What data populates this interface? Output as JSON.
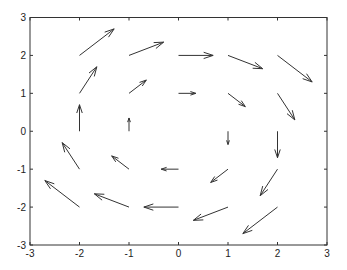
{
  "chart_data": {
    "type": "quiver",
    "title": "",
    "xlabel": "",
    "ylabel": "",
    "xlim": [
      -3,
      3
    ],
    "ylim": [
      -3,
      3
    ],
    "grid": false,
    "legend": null,
    "x_ticks": [
      -3,
      -2,
      -1,
      0,
      1,
      2,
      3
    ],
    "y_ticks": [
      -3,
      -2,
      -1,
      0,
      1,
      2,
      3
    ],
    "x_tick_labels": [
      "-3",
      "-2",
      "-1",
      "0",
      "1",
      "2",
      "3"
    ],
    "y_tick_labels": [
      "-3",
      "-2",
      "-1",
      "0",
      "1",
      "2",
      "3"
    ],
    "field_description": "rotational field u = 0.35*y, v = -0.35*x (clockwise)",
    "vectors": [
      {
        "x": -2,
        "y": -2,
        "u": -0.7,
        "v": 0.7
      },
      {
        "x": -2,
        "y": -1,
        "u": -0.35,
        "v": 0.7
      },
      {
        "x": -2,
        "y": 0,
        "u": 0,
        "v": 0.7
      },
      {
        "x": -2,
        "y": 1,
        "u": 0.35,
        "v": 0.7
      },
      {
        "x": -2,
        "y": 2,
        "u": 0.7,
        "v": 0.7
      },
      {
        "x": -1,
        "y": -2,
        "u": -0.7,
        "v": 0.35
      },
      {
        "x": -1,
        "y": -1,
        "u": -0.35,
        "v": 0.35
      },
      {
        "x": -1,
        "y": 0,
        "u": 0,
        "v": 0.35
      },
      {
        "x": -1,
        "y": 1,
        "u": 0.35,
        "v": 0.35
      },
      {
        "x": -1,
        "y": 2,
        "u": 0.7,
        "v": 0.35
      },
      {
        "x": 0,
        "y": -2,
        "u": -0.7,
        "v": 0
      },
      {
        "x": 0,
        "y": -1,
        "u": -0.35,
        "v": 0
      },
      {
        "x": 0,
        "y": 1,
        "u": 0.35,
        "v": 0
      },
      {
        "x": 0,
        "y": 2,
        "u": 0.7,
        "v": 0
      },
      {
        "x": 1,
        "y": -2,
        "u": -0.7,
        "v": -0.35
      },
      {
        "x": 1,
        "y": -1,
        "u": -0.35,
        "v": -0.35
      },
      {
        "x": 1,
        "y": 0,
        "u": 0,
        "v": -0.35
      },
      {
        "x": 1,
        "y": 1,
        "u": 0.35,
        "v": -0.35
      },
      {
        "x": 1,
        "y": 2,
        "u": 0.7,
        "v": -0.35
      },
      {
        "x": 2,
        "y": -2,
        "u": -0.7,
        "v": -0.7
      },
      {
        "x": 2,
        "y": -1,
        "u": -0.35,
        "v": -0.7
      },
      {
        "x": 2,
        "y": 0,
        "u": 0,
        "v": -0.7
      },
      {
        "x": 2,
        "y": 1,
        "u": 0.35,
        "v": -0.7
      },
      {
        "x": 2,
        "y": 2,
        "u": 0.7,
        "v": -0.7
      }
    ],
    "colors": {
      "arrow": "#333333",
      "axes": "#333333",
      "background": "#ffffff"
    }
  }
}
